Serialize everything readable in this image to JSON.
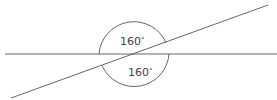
{
  "diagram": {
    "type": "intersecting-lines-angles",
    "angles": [
      {
        "label": "160°",
        "value": "160",
        "unit": "°",
        "position": "upper"
      },
      {
        "label": "160°",
        "value": "160",
        "unit": "°",
        "position": "lower"
      }
    ],
    "colors": {
      "line": "#555555",
      "text": "#444444",
      "background": "#ffffff"
    }
  }
}
